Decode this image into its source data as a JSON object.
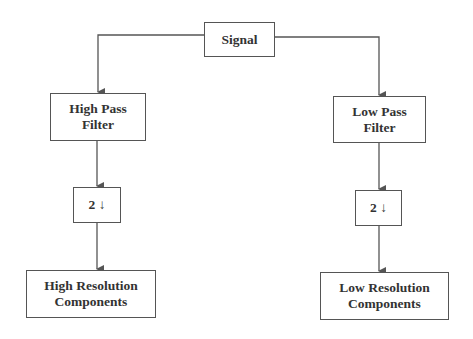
{
  "diagram": {
    "nodes": {
      "signal": {
        "label": "Signal"
      },
      "high_pass_filter": {
        "label": "High Pass\nFilter"
      },
      "low_pass_filter": {
        "label": "Low Pass\nFilter"
      },
      "downsample_left": {
        "label": "2 ↓"
      },
      "downsample_right": {
        "label": "2 ↓"
      },
      "high_resolution": {
        "label": "High Resolution\nComponents"
      },
      "low_resolution": {
        "label": "Low Resolution\nComponents"
      }
    },
    "edges": [
      {
        "from": "signal",
        "to": "high_pass_filter"
      },
      {
        "from": "signal",
        "to": "low_pass_filter"
      },
      {
        "from": "high_pass_filter",
        "to": "downsample_left"
      },
      {
        "from": "low_pass_filter",
        "to": "downsample_right"
      },
      {
        "from": "downsample_left",
        "to": "high_resolution"
      },
      {
        "from": "downsample_right",
        "to": "low_resolution"
      }
    ],
    "colors": {
      "line": "#555555",
      "text": "#333333",
      "background": "#ffffff"
    }
  }
}
